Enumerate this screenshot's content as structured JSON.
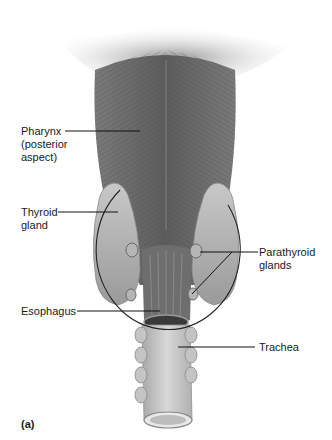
{
  "figure": {
    "panel_label": "(a)",
    "labels": {
      "pharynx": [
        "Pharynx",
        "(posterior",
        "aspect)"
      ],
      "thyroid": [
        "Thyroid",
        "gland"
      ],
      "parathyroid": [
        "Parathyroid",
        "glands"
      ],
      "esophagus": "Esophagus",
      "trachea": "Trachea"
    }
  }
}
